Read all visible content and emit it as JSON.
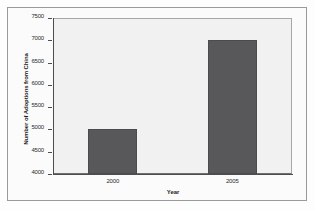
{
  "chart_data": {
    "type": "bar",
    "title": "",
    "xlabel": "Year",
    "ylabel": "Number of Adoptions from China",
    "categories": [
      "2000",
      "2005"
    ],
    "values": [
      5000,
      7000
    ],
    "series": [
      {
        "name": "Number of Adoptions from China",
        "values": [
          5000,
          7000
        ]
      }
    ],
    "ylim": [
      4000,
      7500
    ],
    "ytick_labels": [
      "7500",
      "7000",
      "6500",
      "6000",
      "5500",
      "5000",
      "4500",
      "4000"
    ],
    "ytick_values": [
      7500,
      7000,
      6500,
      6000,
      5500,
      5000,
      4500,
      4000
    ],
    "xtick_labels": [
      "2000",
      "2005"
    ],
    "grid": false,
    "legend": "none",
    "bar_color": "#58585a",
    "plot_background": "#f1f1f1",
    "axis_color": "#4d4d4d",
    "frame_color": "#9a9a9a"
  }
}
